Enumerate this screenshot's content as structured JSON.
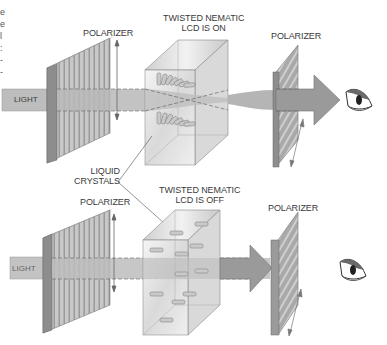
{
  "diagram": {
    "type": "twisted-nematic-lcd-schematic",
    "clipped_left_text_fragments": [
      "e",
      "e",
      "l",
      ":",
      "-",
      "-"
    ],
    "panels": [
      {
        "id": "on",
        "beam_label": "LIGHT",
        "front_polarizer_label": "POLARIZER",
        "lcd_label_line1": "TWISTED NEMATIC",
        "lcd_label_line2": "LCD IS ON",
        "rear_polarizer_label": "POLARIZER",
        "light_passes": true
      },
      {
        "id": "off",
        "beam_label": "LIGHT",
        "front_polarizer_label": "POLARIZER",
        "lcd_label_line1": "TWISTED NEMATIC",
        "lcd_label_line2": "LCD IS OFF",
        "rear_polarizer_label": "POLARIZER",
        "light_passes": false
      }
    ],
    "callout": {
      "line1": "LIQUID",
      "line2": "CRYSTALS"
    },
    "icons": [
      "eye-icon",
      "eye-icon"
    ],
    "colors": {
      "beam": "#b9b9b9",
      "beam_dark": "#8e8e8e",
      "polarizer_face": "#bdbdbd",
      "polarizer_edge": "#8a8a8a",
      "lcd_glass": "#e4e4e4",
      "text": "#3a3a3a"
    }
  }
}
